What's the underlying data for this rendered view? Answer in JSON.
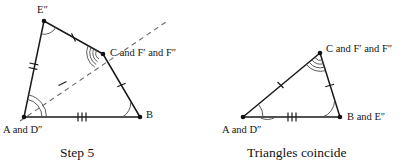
{
  "figure": {
    "title_step5": "Step 5",
    "title_coincide": "Triangles coincide",
    "left_diagram": {
      "name": "Step 5 construction",
      "labels": {
        "e_double_prime": "E″",
        "c_and_f": "C and F′ and F″",
        "a_and_d": "A and D″",
        "b": "B"
      },
      "vertices": {
        "A": [
          24,
          117
        ],
        "B": [
          140,
          117
        ],
        "C": [
          103,
          54
        ],
        "E2": [
          44,
          21
        ]
      },
      "dashed_ray": {
        "from": [
          20,
          121
        ],
        "to": [
          166,
          22
        ],
        "description": "dashed construction ray from A and D″ through C"
      },
      "tick_marks": {
        "A_to_E2": 2,
        "E2_to_C": 1,
        "C_to_B": 1,
        "A_to_B": 3,
        "A_to_C_dashed": 1
      },
      "angle_arcs": {
        "A": 2,
        "B": 1,
        "C": 4,
        "E2": 1
      }
    },
    "right_diagram": {
      "name": "Coincident triangle",
      "labels": {
        "c_and_f": "C and F′ and F″",
        "a_and_d": "A and D″",
        "b_and_e": "B and E″"
      },
      "vertices": {
        "A": [
          243,
          117
        ],
        "B": [
          340,
          117
        ],
        "C": [
          320,
          53
        ]
      },
      "tick_marks": {
        "A_to_C": 1,
        "C_to_B": 1,
        "A_to_B": 3
      },
      "angle_arcs": {
        "A": 2,
        "B": 1,
        "C": 4
      }
    },
    "colors": {
      "ink": "#1a1a1a",
      "dashed": "#6b6b6b",
      "arc": "#4a4a4a",
      "background": "#ffffff"
    }
  }
}
